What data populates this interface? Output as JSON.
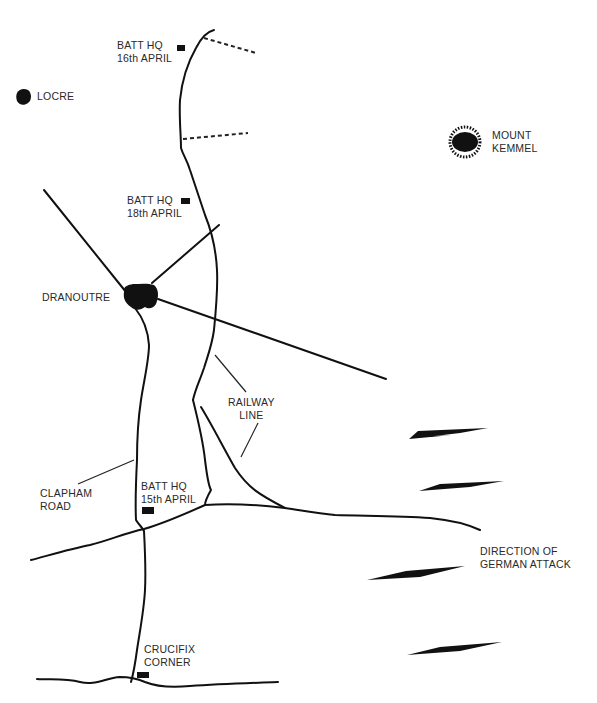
{
  "map": {
    "places": [
      {
        "id": "locre",
        "label_lines": [
          "LOCRE"
        ]
      },
      {
        "id": "mount-kemmel",
        "label_lines": [
          "MOUNT",
          "KEMMEL"
        ]
      },
      {
        "id": "dranoutre",
        "label_lines": [
          "DRANOUTRE"
        ]
      },
      {
        "id": "crucifix-corner",
        "label_lines": [
          "CRUCIFIX",
          "CORNER"
        ]
      }
    ],
    "headquarters": [
      {
        "id": "hq-16",
        "label_lines": [
          "BATT HQ",
          "16th APRIL"
        ]
      },
      {
        "id": "hq-18",
        "label_lines": [
          "BATT HQ",
          "18th APRIL"
        ]
      },
      {
        "id": "hq-15",
        "label_lines": [
          "BATT HQ",
          "15th APRIL"
        ]
      }
    ],
    "features": [
      {
        "id": "railway",
        "label_lines": [
          "RAILWAY",
          "LINE"
        ]
      },
      {
        "id": "clapham-road",
        "label_lines": [
          "CLAPHAM",
          "ROAD"
        ]
      }
    ],
    "legend": {
      "attack_label_lines": [
        "DIRECTION OF",
        "GERMAN ATTACK"
      ],
      "arrow_count": 4
    },
    "colors": {
      "ink": "#111111",
      "text": "#2a2a2a",
      "background": "#ffffff"
    }
  }
}
